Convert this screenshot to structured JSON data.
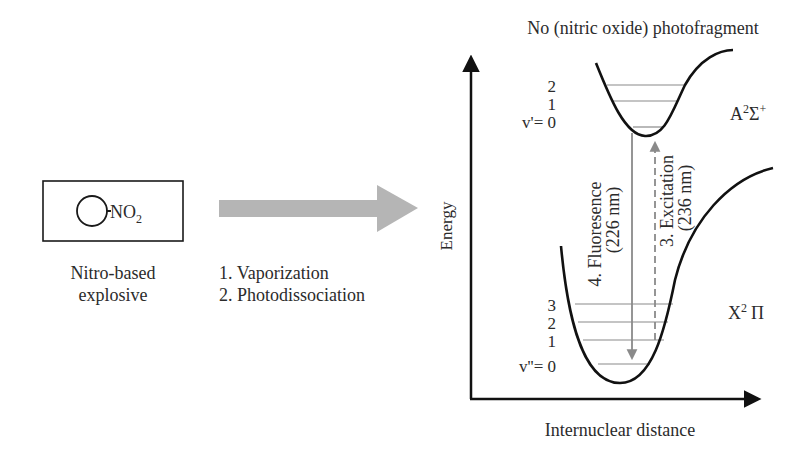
{
  "left_panel": {
    "molecule_label": "NO",
    "molecule_subscript": "2",
    "caption_line1": "Nitro-based",
    "caption_line2": "explosive"
  },
  "process_arrow": {
    "step1": "1. Vaporization",
    "step2": "2. Photodissociation",
    "color": "#b0b0b0"
  },
  "energy_diagram": {
    "title": "No (nitric oxide) photofragment",
    "y_axis_label": "Energy",
    "x_axis_label": "Internuclear distance",
    "upper_state": {
      "label_main": "A",
      "label_sup1": "2",
      "label_sigma": "Σ",
      "label_sup2": "+",
      "levels": [
        "2",
        "1",
        "v'= 0"
      ]
    },
    "lower_state": {
      "label_main": "X",
      "label_sup": "2",
      "label_pi": "Π",
      "levels": [
        "3",
        "2",
        "1",
        "v''= 0"
      ]
    },
    "fluorescence": {
      "label": "4. Fluoresence",
      "wavelength": "(226 nm)"
    },
    "excitation": {
      "label": "3. Excitation",
      "wavelength": "(236 nm)"
    },
    "transition_color": "#8a8a8a",
    "level_color": "#8a8a8a"
  }
}
